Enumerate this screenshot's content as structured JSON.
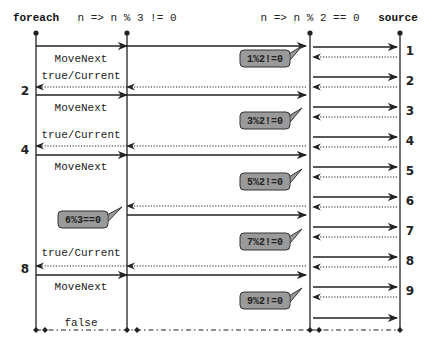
{
  "diagram": {
    "width": 433,
    "height": 351,
    "colors": {
      "line": "#222222",
      "bubble_fill": "#9a9a9a",
      "bubble_stroke": "#333333",
      "background": "#ffffff"
    },
    "lifelines": [
      {
        "id": "foreach",
        "label": "foreach",
        "bold": true,
        "x": 36,
        "label_x": 36,
        "top": 33,
        "bottom": 330
      },
      {
        "id": "filter3",
        "label": "n => n % 3 != 0",
        "bold": false,
        "x": 127,
        "label_x": 127,
        "top": 33,
        "bottom": 330
      },
      {
        "id": "filter2",
        "label": "n => n % 2 == 0",
        "bold": false,
        "x": 310,
        "label_x": 310,
        "top": 33,
        "bottom": 330
      },
      {
        "id": "source",
        "label": "source",
        "bold": true,
        "x": 400,
        "label_x": 398,
        "top": 33,
        "bottom": 330
      }
    ],
    "messages": [
      {
        "from": 36,
        "to": 127,
        "y": 46,
        "style": "solid"
      },
      {
        "from": 127,
        "to": 36,
        "y": 87,
        "style": "dotted"
      },
      {
        "from": 36,
        "to": 127,
        "y": 95,
        "style": "solid"
      },
      {
        "from": 127,
        "to": 36,
        "y": 146,
        "style": "dotted"
      },
      {
        "from": 36,
        "to": 127,
        "y": 155,
        "style": "solid"
      },
      {
        "from": 127,
        "to": 36,
        "y": 266,
        "style": "dotted"
      },
      {
        "from": 36,
        "to": 127,
        "y": 275,
        "style": "solid"
      },
      {
        "from": 127,
        "to": 306,
        "y": 46,
        "style": "solid"
      },
      {
        "from": 306,
        "to": 127,
        "y": 87,
        "style": "dotted"
      },
      {
        "from": 127,
        "to": 306,
        "y": 95,
        "style": "solid"
      },
      {
        "from": 306,
        "to": 127,
        "y": 146,
        "style": "dotted"
      },
      {
        "from": 127,
        "to": 306,
        "y": 155,
        "style": "solid"
      },
      {
        "from": 306,
        "to": 127,
        "y": 206,
        "style": "dotted"
      },
      {
        "from": 127,
        "to": 306,
        "y": 215,
        "style": "solid"
      },
      {
        "from": 306,
        "to": 127,
        "y": 266,
        "style": "dotted"
      },
      {
        "from": 127,
        "to": 306,
        "y": 275,
        "style": "solid"
      },
      {
        "from": 313,
        "to": 397,
        "y": 47,
        "style": "solid"
      },
      {
        "from": 397,
        "to": 313,
        "y": 57,
        "style": "dotted"
      },
      {
        "from": 313,
        "to": 397,
        "y": 77,
        "style": "solid"
      },
      {
        "from": 397,
        "to": 313,
        "y": 87,
        "style": "dotted"
      },
      {
        "from": 313,
        "to": 397,
        "y": 107,
        "style": "solid"
      },
      {
        "from": 397,
        "to": 313,
        "y": 117,
        "style": "dotted"
      },
      {
        "from": 313,
        "to": 397,
        "y": 137,
        "style": "solid"
      },
      {
        "from": 397,
        "to": 313,
        "y": 147,
        "style": "dotted"
      },
      {
        "from": 313,
        "to": 397,
        "y": 167,
        "style": "solid"
      },
      {
        "from": 397,
        "to": 313,
        "y": 177,
        "style": "dotted"
      },
      {
        "from": 313,
        "to": 397,
        "y": 197,
        "style": "solid"
      },
      {
        "from": 397,
        "to": 313,
        "y": 207,
        "style": "dotted"
      },
      {
        "from": 313,
        "to": 397,
        "y": 227,
        "style": "solid"
      },
      {
        "from": 397,
        "to": 313,
        "y": 237,
        "style": "dotted"
      },
      {
        "from": 313,
        "to": 397,
        "y": 257,
        "style": "solid"
      },
      {
        "from": 397,
        "to": 313,
        "y": 267,
        "style": "dotted"
      },
      {
        "from": 313,
        "to": 397,
        "y": 287,
        "style": "solid"
      },
      {
        "from": 397,
        "to": 313,
        "y": 297,
        "style": "dotted"
      },
      {
        "from": 313,
        "to": 397,
        "y": 318,
        "style": "solid"
      }
    ],
    "message_labels": [
      {
        "text": "MoveNext",
        "x": 81,
        "y": 62
      },
      {
        "text": "true/Current",
        "x": 81,
        "y": 79
      },
      {
        "text": "MoveNext",
        "x": 81,
        "y": 111
      },
      {
        "text": "true/Current",
        "x": 81,
        "y": 138
      },
      {
        "text": "MoveNext",
        "x": 81,
        "y": 170
      },
      {
        "text": "true/Current",
        "x": 81,
        "y": 256
      },
      {
        "text": "MoveNext",
        "x": 81,
        "y": 290
      },
      {
        "text": "false",
        "x": 81,
        "y": 326
      }
    ],
    "yield_numbers_left": [
      {
        "text": "2",
        "x": 25,
        "y": 95
      },
      {
        "text": "4",
        "x": 25,
        "y": 154
      },
      {
        "text": "8",
        "x": 25,
        "y": 273
      }
    ],
    "source_numbers": [
      {
        "text": "1",
        "x": 410,
        "y": 55
      },
      {
        "text": "2",
        "x": 410,
        "y": 85
      },
      {
        "text": "3",
        "x": 410,
        "y": 115
      },
      {
        "text": "4",
        "x": 410,
        "y": 145
      },
      {
        "text": "5",
        "x": 410,
        "y": 175
      },
      {
        "text": "6",
        "x": 410,
        "y": 205
      },
      {
        "text": "7",
        "x": 410,
        "y": 235
      },
      {
        "text": "8",
        "x": 410,
        "y": 265
      },
      {
        "text": "9",
        "x": 410,
        "y": 295
      }
    ],
    "bubbles": [
      {
        "text": "1%2!=0",
        "x": 240,
        "y": 50,
        "w": 50,
        "h": 17,
        "tail_to_x": 302,
        "tail_to_y": 52
      },
      {
        "text": "3%2!=0",
        "x": 240,
        "y": 112,
        "w": 50,
        "h": 17,
        "tail_to_x": 302,
        "tail_to_y": 114
      },
      {
        "text": "5%2!=0",
        "x": 240,
        "y": 173,
        "w": 50,
        "h": 17,
        "tail_to_x": 302,
        "tail_to_y": 175
      },
      {
        "text": "6%3==0",
        "x": 58,
        "y": 211,
        "w": 50,
        "h": 17,
        "tail_to_x": 122,
        "tail_to_y": 213
      },
      {
        "text": "7%2!=0",
        "x": 240,
        "y": 233,
        "w": 50,
        "h": 17,
        "tail_to_x": 302,
        "tail_to_y": 235
      },
      {
        "text": "9%2!=0",
        "x": 240,
        "y": 292,
        "w": 50,
        "h": 17,
        "tail_to_x": 302,
        "tail_to_y": 294
      }
    ],
    "end_line": {
      "y": 330,
      "x1": 36,
      "x2": 400,
      "style": "dash-dot",
      "dots": [
        36,
        45,
        127,
        137,
        310,
        319,
        400
      ]
    }
  }
}
